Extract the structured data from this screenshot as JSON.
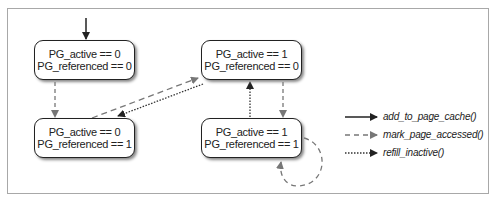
{
  "diagram": {
    "states": [
      {
        "id": "s00",
        "line1": "PG_active == 0",
        "line2": "PG_referenced == 0"
      },
      {
        "id": "s01",
        "line1": "PG_active == 0",
        "line2": "PG_referenced == 1"
      },
      {
        "id": "s10",
        "line1": "PG_active == 1",
        "line2": "PG_referenced == 0"
      },
      {
        "id": "s11",
        "line1": "PG_active == 1",
        "line2": "PG_referenced == 1"
      }
    ],
    "transitions": [
      {
        "from": "entry",
        "to": "s00",
        "type": "add_to_page_cache"
      },
      {
        "from": "s00",
        "to": "s01",
        "type": "mark_page_accessed"
      },
      {
        "from": "s01",
        "to": "s10",
        "type": "mark_page_accessed"
      },
      {
        "from": "s10",
        "to": "s01",
        "type": "refill_inactive"
      },
      {
        "from": "s10",
        "to": "s11",
        "type": "mark_page_accessed"
      },
      {
        "from": "s11",
        "to": "s10",
        "type": "refill_inactive"
      },
      {
        "from": "s11",
        "to": "s11",
        "type": "mark_page_accessed"
      }
    ],
    "legend": [
      {
        "style": "solid",
        "label": "add_to_page_cache()"
      },
      {
        "style": "dashed",
        "label": "mark_page_accessed()"
      },
      {
        "style": "dotted",
        "label": "refill_inactive()"
      }
    ]
  }
}
